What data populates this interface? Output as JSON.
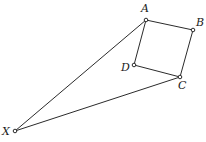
{
  "figure": {
    "canvas": {
      "width": 206,
      "height": 142,
      "background": "#ffffff"
    },
    "style": {
      "stroke_color": "#2b2b2b",
      "stroke_width": 1,
      "vertex_marker": "open-circle",
      "vertex_marker_radius": 1.8,
      "vertex_fill": "#ffffff",
      "label_color": "#1a1a1a",
      "label_font_size": 11,
      "label_style": "italic"
    },
    "points": [
      {
        "id": "A",
        "label": "A",
        "x": 146,
        "y": 20,
        "label_x": 141,
        "label_y": 3
      },
      {
        "id": "B",
        "label": "B",
        "x": 193,
        "y": 30,
        "label_x": 196,
        "label_y": 17
      },
      {
        "id": "C",
        "label": "C",
        "x": 180,
        "y": 77,
        "label_x": 178,
        "label_y": 80
      },
      {
        "id": "D",
        "label": "D",
        "x": 134,
        "y": 65,
        "label_x": 121,
        "label_y": 62
      },
      {
        "id": "X",
        "label": "X",
        "x": 15,
        "y": 131,
        "label_x": 2,
        "label_y": 126
      }
    ],
    "segments": [
      {
        "id": "AB",
        "from": "A",
        "to": "B"
      },
      {
        "id": "BC",
        "from": "B",
        "to": "C"
      },
      {
        "id": "CD",
        "from": "C",
        "to": "D"
      },
      {
        "id": "DA",
        "from": "D",
        "to": "A"
      },
      {
        "id": "XA",
        "from": "X",
        "to": "A"
      },
      {
        "id": "XC",
        "from": "X",
        "to": "C"
      }
    ]
  }
}
